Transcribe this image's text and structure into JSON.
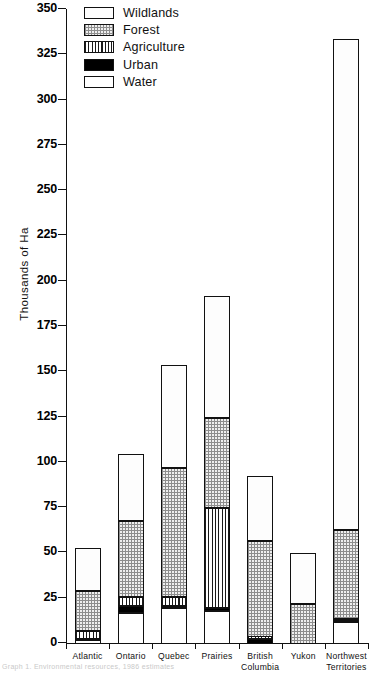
{
  "chart_data": {
    "type": "bar",
    "title": "",
    "subtitle": "",
    "xlabel": "",
    "ylabel": "Thousands of Ha",
    "ylim": [
      0,
      350
    ],
    "ytick_step": 25,
    "yticks": [
      0,
      25,
      50,
      75,
      100,
      125,
      150,
      175,
      200,
      225,
      250,
      275,
      300,
      325,
      350
    ],
    "grid": false,
    "stacked": true,
    "stack_order_bottom_to_top": [
      "Water",
      "Urban",
      "Agriculture",
      "Forest",
      "Wildlands"
    ],
    "legend_position": "top-left",
    "categories": [
      "Atlantic",
      "Ontario",
      "Quebec",
      "Prairies",
      "British Columbia",
      "Yukon",
      "Northwest Territories"
    ],
    "category_label_lines": [
      [
        "Atlantic"
      ],
      [
        "Ontario"
      ],
      [
        "Quebec"
      ],
      [
        "Prairies"
      ],
      [
        "British",
        "Columbia"
      ],
      [
        "Yukon"
      ],
      [
        "Northwest",
        "Territories"
      ]
    ],
    "series": [
      {
        "name": "Water",
        "values": [
          2,
          17,
          20,
          18,
          0,
          0,
          12
        ]
      },
      {
        "name": "Urban",
        "values": [
          1,
          4,
          1,
          2,
          3,
          0,
          1
        ]
      },
      {
        "name": "Agriculture",
        "values": [
          4,
          5,
          5,
          55,
          1,
          0,
          1
        ]
      },
      {
        "name": "Forest",
        "values": [
          22,
          42,
          71,
          50,
          53,
          22,
          49
        ]
      },
      {
        "name": "Wildlands",
        "values": [
          24,
          37,
          57,
          67,
          36,
          28,
          271
        ]
      }
    ],
    "totals": [
      53,
      105,
      154,
      192,
      93,
      50,
      334
    ]
  },
  "legend": {
    "items": [
      {
        "label": "Wildlands",
        "pattern": "dotted"
      },
      {
        "label": "Forest",
        "pattern": "checkered"
      },
      {
        "label": "Agriculture",
        "pattern": "vertical-stripes"
      },
      {
        "label": "Urban",
        "pattern": "solid-black"
      },
      {
        "label": "Water",
        "pattern": "white"
      }
    ]
  },
  "axes": {
    "y_title": "Thousands of Ha",
    "y_tick_labels": [
      "0",
      "25",
      "50",
      "75",
      "100",
      "125",
      "150",
      "175",
      "200",
      "225",
      "250",
      "275",
      "300",
      "325",
      "350"
    ]
  },
  "caption": {
    "text": "Graph 1. Environmental resources, 1986 estimates"
  },
  "colors": {
    "axis": "#111111",
    "wildlands": "#fdfdfd",
    "forest": "#efefef",
    "agriculture": "#ffffff",
    "urban": "#000000",
    "water": "#ffffff"
  }
}
